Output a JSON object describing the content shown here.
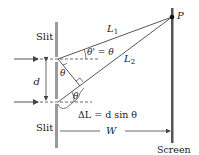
{
  "labels": {
    "slit_top": "Slit",
    "slit_bottom": "Slit",
    "screen": "Screen",
    "point": "P",
    "path1": "L",
    "path1_sub": "1",
    "path2": "L",
    "path2_sub": "2",
    "angle_eq": "θ' = θ",
    "theta_upper": "θ",
    "theta_lower": "θ",
    "separation": "d",
    "path_difference": "ΔL = d sin θ",
    "distance": "W"
  },
  "colors": {
    "barrier": "#9a9a9a",
    "screen": "#555555",
    "lines": "#444444"
  }
}
